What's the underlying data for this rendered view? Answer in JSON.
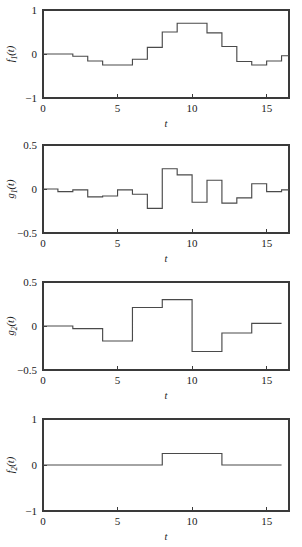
{
  "figure": {
    "width": 302,
    "height": 547,
    "background": "#ffffff",
    "line_color": "#4a4a4a",
    "axis_color": "#3a3a3a",
    "panel_count": 4
  },
  "chart_data": [
    {
      "type": "line",
      "subtype": "step",
      "id": "panel-1",
      "title": "",
      "xlabel": "t",
      "ylabel": "f1(t)",
      "ylabel_base": "f",
      "ylabel_sub": "1",
      "ylabel_tail": "(t)",
      "xlim": [
        0,
        16.5
      ],
      "ylim": [
        -1,
        1
      ],
      "xticks": [
        0,
        5,
        10,
        15
      ],
      "xticklabels": [
        "0",
        "5",
        "10",
        "15"
      ],
      "yticks": [
        -1,
        0,
        1
      ],
      "yticklabels": [
        "-1",
        "0",
        "1"
      ],
      "grid": false,
      "legend": null,
      "step_width": 1,
      "x": [
        0,
        1,
        2,
        3,
        4,
        5,
        6,
        7,
        8,
        9,
        10,
        11,
        12,
        13,
        14,
        15,
        16
      ],
      "values": [
        0.0,
        0.0,
        -0.05,
        -0.16,
        -0.25,
        -0.25,
        -0.12,
        0.15,
        0.5,
        0.7,
        0.7,
        0.48,
        0.17,
        -0.17,
        -0.25,
        -0.16,
        -0.04,
        0.03
      ]
    },
    {
      "type": "line",
      "subtype": "step",
      "id": "panel-2",
      "title": "",
      "xlabel": "t",
      "ylabel": "g1(t)",
      "ylabel_base": "g",
      "ylabel_sub": "1",
      "ylabel_tail": "(t)",
      "xlim": [
        0,
        16.5
      ],
      "ylim": [
        -0.5,
        0.5
      ],
      "xticks": [
        0,
        5,
        10,
        15
      ],
      "xticklabels": [
        "0",
        "5",
        "10",
        "15"
      ],
      "yticks": [
        -0.5,
        0,
        0.5
      ],
      "yticklabels": [
        "-0.5",
        "0",
        "0.5"
      ],
      "grid": false,
      "legend": null,
      "step_width": 1,
      "x": [
        0,
        1,
        2,
        3,
        4,
        5,
        6,
        7,
        8,
        9,
        10,
        11,
        12,
        13,
        14,
        15,
        16
      ],
      "values": [
        0.0,
        -0.03,
        -0.01,
        -0.09,
        -0.08,
        -0.01,
        -0.06,
        -0.22,
        0.23,
        0.16,
        -0.15,
        0.1,
        -0.16,
        -0.1,
        0.06,
        -0.03,
        -0.01
      ]
    },
    {
      "type": "line",
      "subtype": "step",
      "id": "panel-3",
      "title": "",
      "xlabel": "t",
      "ylabel": "g2(t)",
      "ylabel_base": "g",
      "ylabel_sub": "2",
      "ylabel_tail": "(t)",
      "xlim": [
        0,
        16.5
      ],
      "ylim": [
        -0.5,
        0.5
      ],
      "xticks": [
        0,
        5,
        10,
        15
      ],
      "xticklabels": [
        "0",
        "5",
        "10",
        "15"
      ],
      "yticks": [
        -0.5,
        0,
        0.5
      ],
      "yticklabels": [
        "-0.5",
        "0",
        "0.5"
      ],
      "grid": false,
      "legend": null,
      "step_width": 2,
      "x": [
        0,
        2,
        4,
        6,
        8,
        10,
        12,
        14,
        16
      ],
      "values": [
        0.0,
        -0.03,
        -0.17,
        0.21,
        0.3,
        -0.29,
        -0.08,
        0.03
      ]
    },
    {
      "type": "line",
      "subtype": "step",
      "id": "panel-4",
      "title": "",
      "xlabel": "t",
      "ylabel": "f2(t)",
      "ylabel_base": "f",
      "ylabel_sub": "2",
      "ylabel_tail": "(t)",
      "xlim": [
        0,
        16.5
      ],
      "ylim": [
        -1,
        1
      ],
      "xticks": [
        0,
        5,
        10,
        15
      ],
      "xticklabels": [
        "0",
        "5",
        "10",
        "15"
      ],
      "yticks": [
        -1,
        0,
        1
      ],
      "yticklabels": [
        "-1",
        "0",
        "1"
      ],
      "grid": false,
      "legend": null,
      "step_width": 4,
      "x": [
        0,
        8,
        12,
        16
      ],
      "values": [
        0.0,
        0.25,
        0.0
      ]
    }
  ]
}
